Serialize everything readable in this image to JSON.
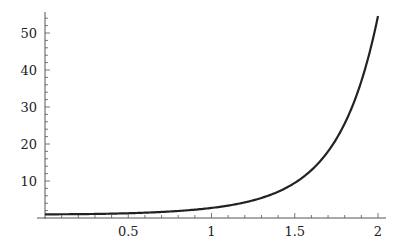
{
  "chart_data": {
    "type": "line",
    "title": "",
    "xlabel": "",
    "ylabel": "",
    "function": "exp(x^2)",
    "xlim": [
      0,
      2
    ],
    "ylim": [
      0,
      55
    ],
    "grid": false,
    "legend": null,
    "x_ticks": [
      "0.5",
      "1",
      "1.5",
      "2"
    ],
    "x_tick_values": [
      0.5,
      1,
      1.5,
      2
    ],
    "y_ticks": [
      "10",
      "20",
      "30",
      "40",
      "50"
    ],
    "y_tick_values": [
      10,
      20,
      30,
      40,
      50
    ],
    "series": [
      {
        "name": "f(x)",
        "x": [
          0,
          0.1,
          0.2,
          0.3,
          0.4,
          0.5,
          0.6,
          0.7,
          0.8,
          0.9,
          1.0,
          1.1,
          1.2,
          1.3,
          1.4,
          1.5,
          1.6,
          1.7,
          1.8,
          1.9,
          2.0
        ],
        "values": [
          1.0,
          1.01,
          1.04,
          1.09,
          1.17,
          1.28,
          1.43,
          1.63,
          1.9,
          2.25,
          2.72,
          3.35,
          4.22,
          5.42,
          7.1,
          9.49,
          12.94,
          17.99,
          25.53,
          36.97,
          54.6
        ]
      }
    ],
    "colors": {
      "line": "#222222",
      "axes": "#555555"
    }
  }
}
